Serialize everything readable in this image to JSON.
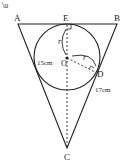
{
  "figure": {
    "points": {
      "A": "A",
      "B": "B",
      "C": "C",
      "D": "D",
      "E": "E",
      "O": "O"
    },
    "labels": {
      "r1": "r",
      "r2": "r",
      "side_left": "15cm",
      "side_right": "17cm",
      "corner_mark": "\\o"
    }
  }
}
